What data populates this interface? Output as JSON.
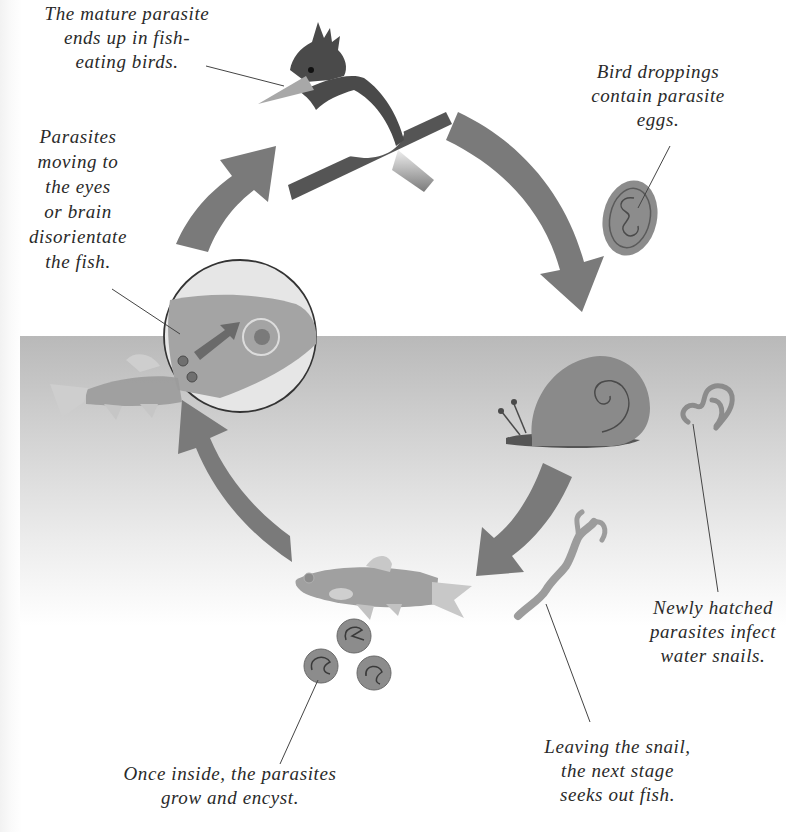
{
  "diagram": {
    "stages": [
      {
        "id": "bird",
        "label": "The mature parasite\nends up in fish-\neating birds."
      },
      {
        "id": "droppings",
        "label": "Bird droppings\ncontain parasite\neggs."
      },
      {
        "id": "snail",
        "label": "Newly hatched\nparasites infect\nwater snails."
      },
      {
        "id": "leaving",
        "label": "Leaving the snail,\nthe next stage\nseeks out fish."
      },
      {
        "id": "encyst",
        "label": "Once inside, the parasites\ngrow and encyst."
      },
      {
        "id": "brain",
        "label": "Parasites\nmoving to\nthe eyes\nor brain\ndisorientate\nthe fish."
      }
    ],
    "flow": [
      "bird",
      "droppings",
      "snail",
      "leaving",
      "encyst",
      "brain",
      "bird"
    ],
    "icons": {
      "bird": "kingfisher-bird-icon",
      "egg": "parasite-egg-icon",
      "snail": "water-snail-icon",
      "larva": "hatched-larva-icon",
      "cercaria": "cercaria-icon",
      "fish": "fish-icon",
      "cysts": "cyst-icon",
      "magnifier": "magnified-fish-head-icon"
    },
    "colors": {
      "arrow": "#7a7a7a",
      "dark": "#4a4a4a",
      "mid": "#8c8c8c",
      "light": "#b5b5b5",
      "water_top": "#b9b9b9",
      "text": "#2a2a2a",
      "leader_line": "#444444"
    }
  }
}
